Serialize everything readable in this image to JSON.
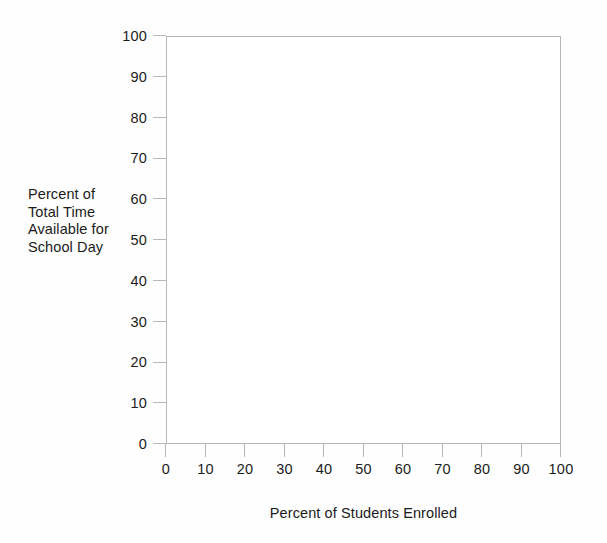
{
  "chart_data": {
    "type": "scatter",
    "title": "",
    "subtitle": "",
    "xlabel": "Percent of Students Enrolled",
    "ylabel": "Percent of Total Time Available for School Day",
    "ylabel_lines": [
      "Percent of",
      "Total Time",
      "Available for",
      "School Day"
    ],
    "xlim": [
      0,
      100
    ],
    "ylim": [
      0,
      100
    ],
    "xticks": [
      0,
      10,
      20,
      30,
      40,
      50,
      60,
      70,
      80,
      90,
      100
    ],
    "yticks": [
      0,
      10,
      20,
      30,
      40,
      50,
      60,
      70,
      80,
      90,
      100
    ],
    "xtick_labels": [
      "0",
      "10",
      "20",
      "30",
      "40",
      "50",
      "60",
      "70",
      "80",
      "90",
      "100"
    ],
    "ytick_labels": [
      "0",
      "10",
      "20",
      "30",
      "40",
      "50",
      "60",
      "70",
      "80",
      "90",
      "100"
    ],
    "grid": false,
    "legend": null,
    "series": [],
    "values": [],
    "annotations": [],
    "note": "Blank plotting grid — axes and labels only, no data points plotted.",
    "colors": {
      "axis": "#b7b7b7",
      "text": "#1b1b1b",
      "plot_background": "#ffffff",
      "page_background": "#fefefe"
    }
  }
}
